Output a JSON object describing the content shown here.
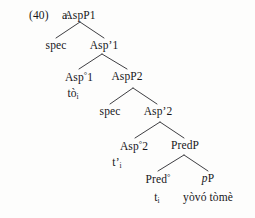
{
  "figure": {
    "example_number": "(40)",
    "item_letter": "a.",
    "type": "syntax-tree"
  },
  "nodes": {
    "root": "AspP1",
    "spec1": "spec",
    "aspbar1": "Asp’1",
    "asphead1": "Asp",
    "asphead1_deg": "°",
    "asphead1_num": "1",
    "asphead1_word": "tò",
    "asphead1_index": "i",
    "aspp2": "AspP2",
    "spec2": "spec",
    "aspbar2": "Asp’2",
    "asphead2": "Asp",
    "asphead2_deg": "°",
    "asphead2_num": "2",
    "asphead2_trace": "t’",
    "asphead2_index": "i",
    "predp": "PredP",
    "predhead": "Pred",
    "predhead_deg": "°",
    "predhead_trace": "t",
    "predhead_index": "i",
    "pp_small": "p",
    "pp_big": "P",
    "pp_content": "yòvó tòmè"
  },
  "colors": {
    "background": "#fdfdfc",
    "text": "#17171a",
    "branch_line": "#28282c"
  }
}
